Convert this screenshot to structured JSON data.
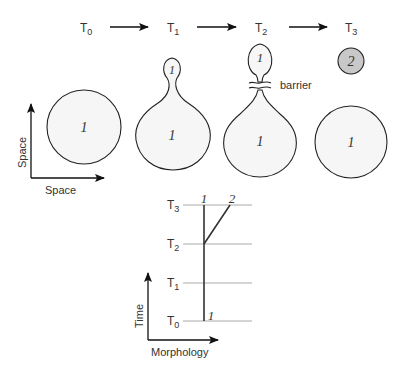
{
  "timeline": {
    "labels": [
      {
        "main": "T",
        "sub": "0"
      },
      {
        "main": "T",
        "sub": "1"
      },
      {
        "main": "T",
        "sub": "2"
      },
      {
        "main": "T",
        "sub": "3"
      }
    ]
  },
  "space_axes": {
    "vertical_label": "Space",
    "horizontal_label": "Space"
  },
  "shapes": {
    "t0_body": "1",
    "t1_bud": "1",
    "t1_body": "1",
    "t2_bud": "1",
    "t2_body": "1",
    "barrier_label": "barrier",
    "t3_offspring": "2",
    "t3_body": "1"
  },
  "colors": {
    "stroke": "#222222",
    "body_fill": "#f6f6f6",
    "offspring_fill": "#c8c8c8",
    "grid_line": "#aaaaaa"
  },
  "lineage_chart": {
    "y_axis_label": "Time",
    "x_axis_label": "Morphology",
    "rows": [
      {
        "main": "T",
        "sub": "3"
      },
      {
        "main": "T",
        "sub": "2"
      },
      {
        "main": "T",
        "sub": "1"
      },
      {
        "main": "T",
        "sub": "0"
      }
    ],
    "lineage_1_top": "1",
    "lineage_2_top": "2",
    "lineage_1_bottom": "1"
  }
}
